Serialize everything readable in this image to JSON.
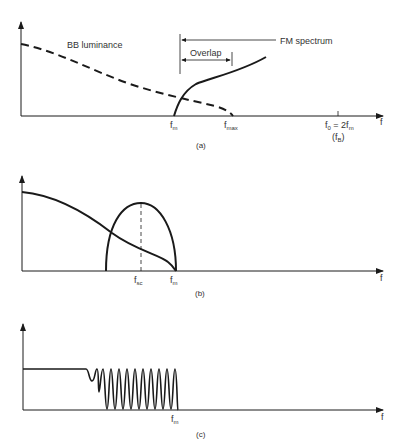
{
  "panels": [
    {
      "id": "a",
      "caption": "(a)",
      "x_axis_label": "f",
      "annotations": {
        "bb_luminance": "BB luminance",
        "fm_spectrum": "FM spectrum",
        "overlap": "Overlap"
      },
      "ticks": {
        "fm": {
          "main": "f",
          "sub": "m"
        },
        "fmax": {
          "main": "f",
          "sub": "max"
        },
        "f0": {
          "main": "f",
          "sub0": "0",
          "eq": " = 2f",
          "sub1": "m"
        },
        "fB": {
          "open": "(f",
          "sub": "B",
          "close": ")"
        }
      },
      "curves": [
        "BB luminance (dashed, decreasing to f_max)",
        "FM spectrum (solid, rising from f_m)"
      ]
    },
    {
      "id": "b",
      "caption": "(b)",
      "x_axis_label": "f",
      "ticks": {
        "fsc": {
          "main": "f",
          "sub": "sc"
        },
        "fm": {
          "main": "f",
          "sub": "m"
        }
      },
      "curves": [
        "Luminance (solid, decreasing to f_m)",
        "Chrominance hump centered at f_sc"
      ]
    },
    {
      "id": "c",
      "caption": "(c)",
      "x_axis_label": "f",
      "ticks": {
        "fm": {
          "main": "f",
          "sub": "m"
        }
      },
      "curves": [
        "Flat response then comb ripple up to f_m"
      ]
    }
  ],
  "colors": {
    "ink": "#1a1a1a",
    "text": "#333333",
    "background": "#ffffff"
  }
}
